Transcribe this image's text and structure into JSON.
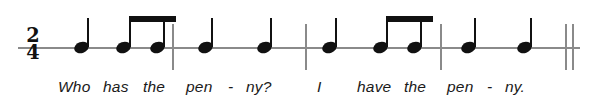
{
  "score": {
    "time_signature": {
      "numerator": "2",
      "denominator": "4"
    },
    "staff": {
      "y": 47,
      "x_start": 18,
      "x_end": 580
    },
    "barlines": [
      {
        "name": "barline-1",
        "x": 172,
        "y": 24,
        "height": 46
      },
      {
        "name": "barline-2",
        "x": 305,
        "y": 24,
        "height": 46
      },
      {
        "name": "barline-3",
        "x": 440,
        "y": 24,
        "height": 46
      }
    ],
    "final_barline": {
      "x1": 565,
      "x2": 572,
      "y": 24,
      "height": 46
    },
    "notes": [
      {
        "name": "note-1",
        "x": 74,
        "stem_top": 18,
        "duration": "quarter",
        "beam_group": null
      },
      {
        "name": "note-2",
        "x": 116,
        "stem_top": 16,
        "duration": "eighth",
        "beam_group": 1
      },
      {
        "name": "note-3",
        "x": 150,
        "stem_top": 16,
        "duration": "eighth",
        "beam_group": 1
      },
      {
        "name": "note-4",
        "x": 198,
        "stem_top": 18,
        "duration": "quarter",
        "beam_group": null
      },
      {
        "name": "note-5",
        "x": 257,
        "stem_top": 18,
        "duration": "quarter",
        "beam_group": null
      },
      {
        "name": "note-6",
        "x": 322,
        "stem_top": 18,
        "duration": "quarter",
        "beam_group": null
      },
      {
        "name": "note-7",
        "x": 373,
        "stem_top": 16,
        "duration": "eighth",
        "beam_group": 2
      },
      {
        "name": "note-8",
        "x": 407,
        "stem_top": 16,
        "duration": "eighth",
        "beam_group": 2
      },
      {
        "name": "note-9",
        "x": 461,
        "stem_top": 18,
        "duration": "quarter",
        "beam_group": null
      },
      {
        "name": "note-10",
        "x": 517,
        "stem_top": 18,
        "duration": "quarter",
        "beam_group": null
      }
    ],
    "beams": [
      {
        "name": "beam-group-1",
        "x": 118,
        "width": 47,
        "y": 16
      },
      {
        "name": "beam-group-2",
        "x": 375,
        "width": 47,
        "y": 16
      }
    ],
    "lyrics": [
      {
        "text": "Who",
        "x": 58
      },
      {
        "text": "has",
        "x": 103
      },
      {
        "text": "the",
        "x": 143
      },
      {
        "text": "pen",
        "x": 186
      },
      {
        "text": "-",
        "x": 228
      },
      {
        "text": "ny?",
        "x": 246
      },
      {
        "text": "I",
        "x": 317
      },
      {
        "text": "have",
        "x": 357
      },
      {
        "text": "the",
        "x": 404
      },
      {
        "text": "pen",
        "x": 447
      },
      {
        "text": "-",
        "x": 487
      },
      {
        "text": "ny.",
        "x": 505
      }
    ],
    "lyrics_baseline_y": 78,
    "colors": {
      "staff": "#8a8a8a",
      "note": "#111111",
      "lyric": "#1a1a1a",
      "background": "#ffffff"
    }
  }
}
